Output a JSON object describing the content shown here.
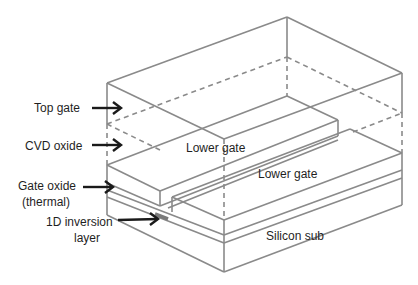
{
  "diagram": {
    "title": "",
    "labels": {
      "top_gate": "Top gate",
      "cvd_oxide": "CVD oxide",
      "gate_oxide_line1": "Gate oxide",
      "gate_oxide_line2": "(thermal)",
      "inversion_line1": "1D inversion",
      "inversion_line2": "layer",
      "lower_gate_upper": "Lower gate",
      "lower_gate_lower": "Lower gate",
      "silicon_sub": "Silicon sub"
    },
    "colors": {
      "edges": "#8a8a8a",
      "arrows": "#1a1a1a",
      "text": "#1f1f1f",
      "inversion_layer": "#7a7a7a",
      "background": "#ffffff"
    }
  }
}
